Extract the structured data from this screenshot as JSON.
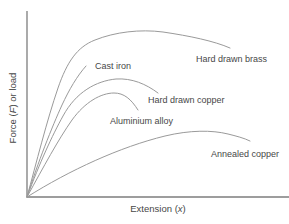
{
  "figure": {
    "background_color": "#ffffff",
    "curve_color": "#9a9a9a",
    "axis_color": "#7d7d7d",
    "text_color": "#474747"
  },
  "axes": {
    "x_label": {
      "pre": "Extension (",
      "var": "x",
      "post": ")"
    },
    "y_label": {
      "pre": "Force (",
      "var": "F",
      "post": ") or load"
    }
  },
  "chart_data": {
    "type": "line",
    "title": "",
    "xlabel": "Extension (x)",
    "ylabel": "Force (F) or load",
    "grid": false,
    "tick_labels": "none",
    "legend": "inline labels next to each curve",
    "x_range_norm": [
      0,
      1
    ],
    "y_range_norm": [
      0,
      1
    ],
    "series": [
      {
        "name": "Hard drawn brass",
        "points_norm": [
          [
            0,
            0
          ],
          [
            0.04,
            0.39
          ],
          [
            0.12,
            0.58
          ],
          [
            0.19,
            0.74
          ],
          [
            0.26,
            0.82
          ],
          [
            0.36,
            0.87
          ],
          [
            0.47,
            0.89
          ],
          [
            0.53,
            0.88
          ],
          [
            0.64,
            0.85
          ],
          [
            0.78,
            0.8
          ]
        ],
        "svg_path": "M27 197 C36 164, 47 120, 58 88 C67 62, 77 47, 95 40 C115 32, 140 29, 163 32 C190 36, 214 41, 230 48"
      },
      {
        "name": "Cast iron",
        "points_norm": [
          [
            0,
            0
          ],
          [
            0.08,
            0.39
          ],
          [
            0.13,
            0.49
          ],
          [
            0.16,
            0.58
          ],
          [
            0.2,
            0.65
          ],
          [
            0.23,
            0.7
          ]
        ],
        "svg_path": "M27 197 C38 162, 52 127, 62 105 C69 90, 77 76, 86 66"
      },
      {
        "name": "Hard drawn copper",
        "points_norm": [
          [
            0,
            0
          ],
          [
            0.12,
            0.39
          ],
          [
            0.18,
            0.55
          ],
          [
            0.26,
            0.61
          ],
          [
            0.36,
            0.63
          ],
          [
            0.43,
            0.6
          ],
          [
            0.5,
            0.56
          ]
        ],
        "svg_path": "M27 197 C40 162, 52 136, 63 116 C76 92, 96 81, 116 79 C132 78, 146 84, 158 93"
      },
      {
        "name": "Aluminium alloy",
        "points_norm": [
          [
            0,
            0
          ],
          [
            0.16,
            0.39
          ],
          [
            0.22,
            0.48
          ],
          [
            0.28,
            0.54
          ],
          [
            0.34,
            0.56
          ],
          [
            0.39,
            0.52
          ],
          [
            0.42,
            0.47
          ]
        ],
        "svg_path": "M27 197 C44 166, 58 140, 72 120 C85 102, 101 93, 114 93 C124 93, 131 99, 138 110"
      },
      {
        "name": "Annealed copper",
        "points_norm": [
          [
            0,
            0
          ],
          [
            0.13,
            0.12
          ],
          [
            0.26,
            0.21
          ],
          [
            0.38,
            0.29
          ],
          [
            0.51,
            0.33
          ],
          [
            0.66,
            0.35
          ],
          [
            0.77,
            0.33
          ],
          [
            0.85,
            0.3
          ]
        ],
        "svg_path": "M27 197 C70 170, 120 147, 165 136 C190 130, 212 130, 228 134 C236 136, 244 138, 250 141"
      }
    ]
  }
}
